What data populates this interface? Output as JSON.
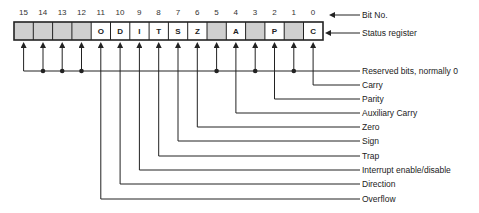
{
  "diagram": {
    "title_labels": {
      "bit_no": "Bit No.",
      "status_register": "Status register"
    },
    "bits": [
      {
        "bit": "15",
        "flag": "",
        "reserved": true
      },
      {
        "bit": "14",
        "flag": "",
        "reserved": true
      },
      {
        "bit": "13",
        "flag": "",
        "reserved": true
      },
      {
        "bit": "12",
        "flag": "",
        "reserved": true
      },
      {
        "bit": "11",
        "flag": "O",
        "reserved": false
      },
      {
        "bit": "10",
        "flag": "D",
        "reserved": false
      },
      {
        "bit": "9",
        "flag": "I",
        "reserved": false
      },
      {
        "bit": "8",
        "flag": "T",
        "reserved": false
      },
      {
        "bit": "7",
        "flag": "S",
        "reserved": false
      },
      {
        "bit": "6",
        "flag": "Z",
        "reserved": false
      },
      {
        "bit": "5",
        "flag": "",
        "reserved": true
      },
      {
        "bit": "4",
        "flag": "A",
        "reserved": false
      },
      {
        "bit": "3",
        "flag": "",
        "reserved": true
      },
      {
        "bit": "2",
        "flag": "P",
        "reserved": false
      },
      {
        "bit": "1",
        "flag": "",
        "reserved": true
      },
      {
        "bit": "0",
        "flag": "C",
        "reserved": false
      }
    ],
    "labels": {
      "reserved": "Reserved bits, normally 0",
      "carry": "Carry",
      "parity": "Parity",
      "auxiliary_carry": "Auxiliary Carry",
      "zero": "Zero",
      "sign": "Sign",
      "trap": "Trap",
      "interrupt": "Interrupt enable/disable",
      "direction": "Direction",
      "overflow": "Overflow"
    },
    "colors": {
      "reserved_fill": "#cfcfcf",
      "line": "#222222"
    }
  }
}
